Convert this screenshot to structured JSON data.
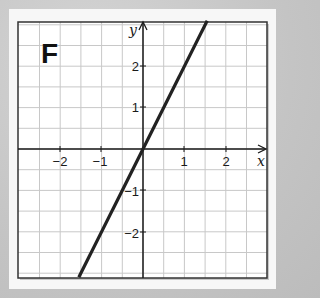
{
  "chart_data": {
    "type": "line",
    "title": "F",
    "xlabel": "x",
    "ylabel": "y",
    "xlim": [
      -3,
      3
    ],
    "ylim": [
      -3.1,
      3.1
    ],
    "grid": true,
    "grid_step": 0.5,
    "x_ticks": [
      -2,
      -1,
      1,
      2
    ],
    "y_ticks": [
      2,
      1,
      -1,
      -2
    ],
    "x_tick_labels": [
      "−2",
      "−1",
      "1",
      "2"
    ],
    "y_tick_labels": [
      "2",
      "1",
      "−1",
      "−2"
    ],
    "series": [
      {
        "name": "y = 2x",
        "equation": "y = 2x",
        "slope": 2,
        "intercept": 0,
        "points": [
          [
            -1.55,
            -3.1
          ],
          [
            0,
            0
          ],
          [
            1.55,
            3.1
          ]
        ]
      }
    ]
  },
  "labels": {
    "panel_letter": "F",
    "x_axis": "x",
    "y_axis": "y",
    "xt0": "−2",
    "xt1": "−1",
    "xt2": "1",
    "xt3": "2",
    "yt0": "2",
    "yt1": "1",
    "yt2": "−1",
    "yt3": "−2"
  },
  "colors": {
    "background": "#c4c4c4",
    "panel": "#f7f7f7",
    "grid": "#c8c8c8",
    "axis": "#1a1a1a",
    "line": "#222222"
  }
}
